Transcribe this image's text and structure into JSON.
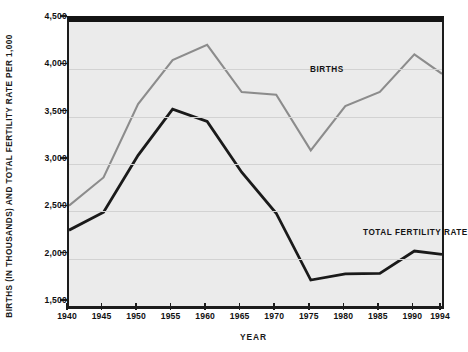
{
  "axes": {
    "ylabel": "BIRTHS (IN THOUSANDS) AND TOTAL FERTILITY RATE PER 1,000",
    "xlabel": "YEAR",
    "ytick_labels": [
      "4,500",
      "4,000",
      "3,500",
      "3,000",
      "2,500",
      "2,000",
      "1,500"
    ],
    "xtick_labels": [
      "1940",
      "1945",
      "1950",
      "1955",
      "1960",
      "1965",
      "1970",
      "1975",
      "1980",
      "1985",
      "1990",
      "1994"
    ]
  },
  "legend": {
    "births": "BIRTHS",
    "total_fertility_rate": "TOTAL FERTILITY RATE"
  },
  "colors": {
    "births_line": "#8c8c8c",
    "tfr_line": "#1a1a1a",
    "plot_background": "#ebebeb",
    "gridline": "#d2d2d2",
    "frame": "#1c1c1c"
  },
  "chart_data": {
    "type": "line",
    "title": "",
    "xlabel": "YEAR",
    "ylabel": "BIRTHS (IN THOUSANDS) AND TOTAL FERTILITY RATE PER 1,000",
    "x": [
      1940,
      1945,
      1950,
      1955,
      1960,
      1965,
      1970,
      1975,
      1980,
      1985,
      1990,
      1994
    ],
    "xlim": [
      1940,
      1994
    ],
    "ylim": [
      1500,
      4500
    ],
    "yticks": [
      1500,
      2000,
      2500,
      3000,
      3500,
      4000,
      4500
    ],
    "grid": true,
    "legend_position": "inline-annotations",
    "series": [
      {
        "name": "BIRTHS",
        "color": "#8c8c8c",
        "values": [
          2560,
          2858,
          3632,
          4097,
          4258,
          3760,
          3731,
          3144,
          3612,
          3761,
          4158,
          3953
        ]
      },
      {
        "name": "TOTAL FERTILITY RATE",
        "color": "#1a1a1a",
        "values": [
          2301,
          2491,
          3091,
          3580,
          3449,
          2913,
          2480,
          1774,
          1840,
          1844,
          2081,
          2046
        ]
      }
    ]
  }
}
